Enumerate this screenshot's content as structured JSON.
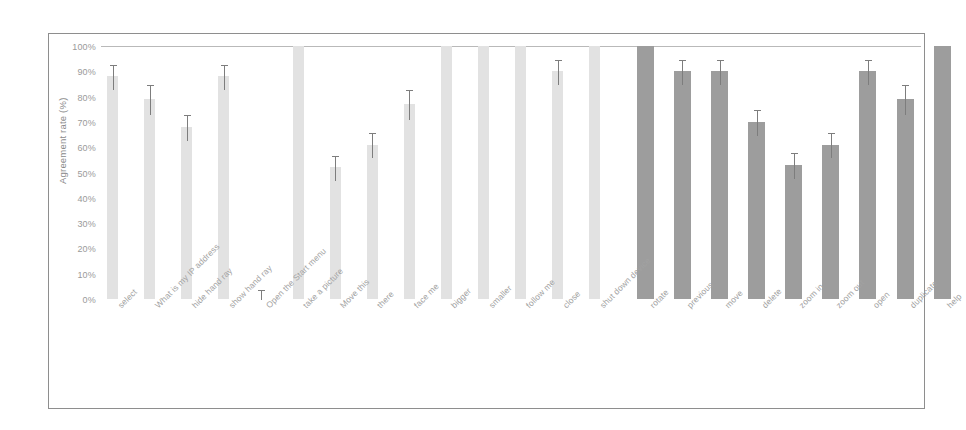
{
  "chart_data": {
    "type": "bar",
    "title": "",
    "subtitle": "",
    "xlabel": "",
    "ylabel": "Agreement rate (%)",
    "ylim": [
      0,
      100
    ],
    "ytick_labels": [
      "100%",
      "90%",
      "80%",
      "70%",
      "60%",
      "50%",
      "40%",
      "30%",
      "20%",
      "10%",
      "0%"
    ],
    "ytick_values": [
      100,
      90,
      80,
      70,
      60,
      50,
      40,
      30,
      20,
      10,
      0
    ],
    "grid": false,
    "legend_position": "none",
    "error_bars": true,
    "group_colors": {
      "group1": "#e2e2e2",
      "group2": "#9d9d9d"
    },
    "categories": [
      "select",
      "What is my IP address",
      "hide hand ray",
      "show hand ray",
      "Open the Start menu",
      "take a picture",
      "Move this",
      "there",
      "face me",
      "bigger",
      "smaller",
      "follow me",
      "close",
      "shut down device",
      "rotate",
      "previous",
      "move",
      "delete",
      "zoom in",
      "zoom out",
      "open",
      "duplicate",
      "help"
    ],
    "values": [
      88,
      79,
      68,
      88,
      0,
      100,
      52,
      61,
      77,
      100,
      100,
      100,
      90,
      100,
      100,
      90,
      90,
      70,
      53,
      61,
      90,
      79,
      100
    ],
    "errors": [
      5,
      6,
      5,
      5,
      4,
      0,
      5,
      5,
      6,
      0,
      0,
      0,
      5,
      0,
      0,
      5,
      5,
      5,
      5,
      5,
      5,
      6,
      0
    ],
    "groups": [
      1,
      1,
      1,
      1,
      1,
      1,
      1,
      1,
      1,
      1,
      1,
      1,
      1,
      1,
      2,
      2,
      2,
      2,
      2,
      2,
      2,
      2,
      2
    ]
  }
}
